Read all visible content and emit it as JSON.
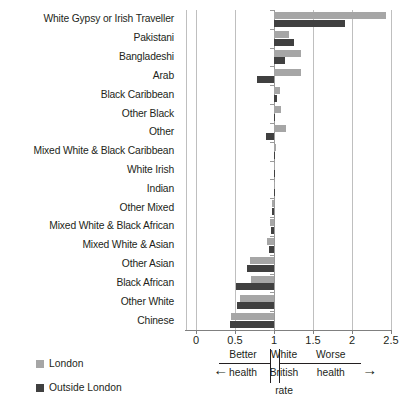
{
  "chart_data": {
    "type": "bar",
    "orientation": "horizontal",
    "title": "",
    "subtitle": "",
    "xlabel": "",
    "ylabel": "",
    "xlim": [
      0,
      2.5
    ],
    "xticks": [
      "0",
      "0.5",
      "1",
      "1.5",
      "2",
      "2.5"
    ],
    "xtick_values": [
      0,
      0.5,
      1,
      1.5,
      2,
      2.5
    ],
    "grid": true,
    "baseline": 1,
    "baseline_note": "White British rate = 1",
    "legend_position": "bottom-left",
    "categories": [
      "White Gypsy or Irish Traveller",
      "Pakistani",
      "Bangladeshi",
      "Arab",
      "Black Caribbean",
      "Other Black",
      "Other",
      "Mixed White & Black Caribbean",
      "White Irish",
      "Indian",
      "Other Mixed",
      "Mixed White & Black African",
      "Mixed White & Asian",
      "Other Asian",
      "Black African",
      "Other White",
      "Chinese"
    ],
    "series": [
      {
        "name": "London",
        "color": "#a6a6a6",
        "values": [
          2.43,
          1.19,
          1.35,
          1.35,
          1.08,
          1.09,
          1.15,
          1.02,
          1.0,
          1.0,
          0.98,
          0.95,
          0.91,
          0.69,
          0.71,
          0.57,
          0.45
        ]
      },
      {
        "name": "Outside London",
        "color": "#404040",
        "values": [
          1.91,
          1.26,
          1.14,
          0.78,
          1.04,
          1.0,
          0.9,
          1.01,
          1.0,
          1.0,
          0.97,
          0.96,
          0.93,
          0.65,
          0.51,
          0.53,
          0.43
        ]
      }
    ],
    "annotations": {
      "left_label_top": "Better",
      "left_label_bottom": "health",
      "center_label_line1": "White",
      "center_label_line2": "British",
      "center_label_line3": "rate",
      "right_label_top": "Worse",
      "right_label_bottom": "health",
      "left_arrow": "←",
      "right_arrow": "→"
    }
  },
  "legend": {
    "items": [
      {
        "label": "London",
        "color": "#a6a6a6"
      },
      {
        "label": "Outside London",
        "color": "#404040"
      }
    ]
  }
}
